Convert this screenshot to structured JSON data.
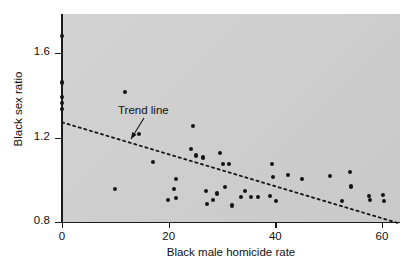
{
  "chart_data": {
    "type": "scatter",
    "title": "",
    "xlabel": "Black male homicide rate",
    "ylabel": "Black sex ratio",
    "xlim": [
      -1.5,
      63.5
    ],
    "ylim": [
      0.78,
      1.72
    ],
    "xticks": [
      0,
      20,
      40,
      60
    ],
    "xtick_labels": [
      "0",
      "20",
      "40",
      "60"
    ],
    "yticks": [
      0.8,
      1.2,
      1.6
    ],
    "ytick_labels": [
      "0.8",
      "1.2",
      "1.6"
    ],
    "grid": false,
    "legend": null,
    "background": "#cfcfcf",
    "marker_color": "#141414",
    "points": [
      [
        0.0,
        1.68
      ],
      [
        0.0,
        1.46
      ],
      [
        0.0,
        1.39
      ],
      [
        0.0,
        1.365
      ],
      [
        0.0,
        1.335
      ],
      [
        10.0,
        0.955
      ],
      [
        11.8,
        1.415
      ],
      [
        14.5,
        1.215
      ],
      [
        17.0,
        1.085
      ],
      [
        19.8,
        0.905
      ],
      [
        21.0,
        0.955
      ],
      [
        21.3,
        0.912
      ],
      [
        21.4,
        1.005
      ],
      [
        24.2,
        1.145
      ],
      [
        24.5,
        1.255
      ],
      [
        25.2,
        1.115
      ],
      [
        26.5,
        1.105
      ],
      [
        27.0,
        0.945
      ],
      [
        27.2,
        0.885
      ],
      [
        28.3,
        0.905
      ],
      [
        29.0,
        0.935
      ],
      [
        29.6,
        1.125
      ],
      [
        30.2,
        1.075
      ],
      [
        30.6,
        0.965
      ],
      [
        31.3,
        1.075
      ],
      [
        31.8,
        0.878
      ],
      [
        33.5,
        0.918
      ],
      [
        34.3,
        0.948
      ],
      [
        35.5,
        0.918
      ],
      [
        36.8,
        0.918
      ],
      [
        39.0,
        0.925
      ],
      [
        39.3,
        1.075
      ],
      [
        39.6,
        1.012
      ],
      [
        40.1,
        0.898
      ],
      [
        42.3,
        1.022
      ],
      [
        45.0,
        1.002
      ],
      [
        50.3,
        1.018
      ],
      [
        52.5,
        0.898
      ],
      [
        54.0,
        1.038
      ],
      [
        54.2,
        0.968
      ],
      [
        57.5,
        0.925
      ],
      [
        57.8,
        0.905
      ],
      [
        60.2,
        0.928
      ],
      [
        60.4,
        0.898
      ]
    ],
    "trend_line": {
      "label": "Trend line",
      "style": "dotted",
      "x_start": 0.0,
      "y_start": 1.272,
      "x_end": 63.0,
      "y_end": 0.795
    },
    "annotation": {
      "text": "Trend line",
      "label_x": 118,
      "label_y": 104,
      "arrow_from_x": 144,
      "arrow_from_y": 118,
      "arrow_to_x": 131,
      "arrow_to_y": 139
    }
  }
}
